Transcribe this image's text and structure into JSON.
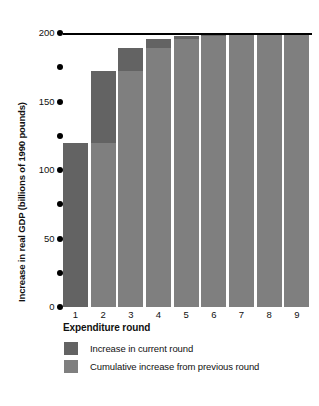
{
  "chart_data": {
    "type": "bar",
    "title": "",
    "subtitle": "",
    "xlabel": "Expenditure round",
    "ylabel": "Increase in real GDP (billions of 1990 pounds)",
    "categories": [
      "1",
      "2",
      "3",
      "4",
      "5",
      "6",
      "7",
      "8",
      "9"
    ],
    "ylim": [
      0,
      200
    ],
    "ytick_values": [
      0,
      25,
      50,
      75,
      100,
      125,
      150,
      175,
      200
    ],
    "ytick_labels": [
      "0",
      "",
      "50",
      "",
      "100",
      "",
      "150",
      "",
      "200"
    ],
    "grid": false,
    "legend_position": "below-axis",
    "stacked": true,
    "series": [
      {
        "name": "Cumulative increase from previous round",
        "color": "#7f7f7f",
        "values": [
          0,
          120,
          172,
          189,
          195.5,
          198,
          199.3,
          199.7,
          199.9
        ]
      },
      {
        "name": "Increase in current round",
        "color": "#636363",
        "values": [
          120,
          52,
          17,
          6.5,
          2.5,
          1.3,
          0.4,
          0.2,
          0.1
        ]
      }
    ],
    "totals": [
      120,
      172,
      189,
      195.5,
      198,
      199.3,
      199.7,
      199.9,
      200
    ],
    "annotations": [
      {
        "kind": "reference-line",
        "axis": "y",
        "value": 200,
        "label": "200",
        "color": "#000000"
      }
    ]
  },
  "legend": {
    "items": [
      {
        "label": "Increase in current round",
        "color": "#636363"
      },
      {
        "label": "Cumulative increase from previous round",
        "color": "#7f7f7f"
      }
    ]
  },
  "colors": {
    "current_round": "#636363",
    "cumulative": "#7f7f7f",
    "axis": "#000000",
    "background": "#ffffff"
  }
}
